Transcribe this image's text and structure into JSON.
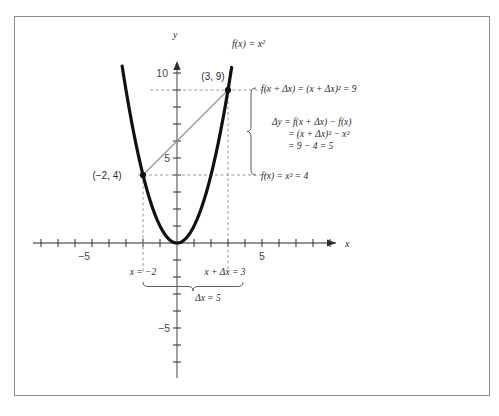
{
  "figure": {
    "watermark": "",
    "border_color": "#8a8a92",
    "background": "#ffffff"
  },
  "axes": {
    "x_axis_label": "x",
    "y_axis_label": "y",
    "x_tick_labels": [
      {
        "value": -5,
        "text": "−5"
      },
      {
        "value": 5,
        "text": "5"
      }
    ],
    "y_tick_labels": [
      {
        "value": 10,
        "text": "10"
      },
      {
        "value": 5,
        "text": "5"
      },
      {
        "value": -5,
        "text": "−5"
      }
    ],
    "x_min": -9,
    "x_max": 9,
    "y_min": -8,
    "y_max": 11,
    "tick_step": 1,
    "origin_px": {
      "x": 177,
      "y": 243
    },
    "unit_px": 17,
    "axis_color": "#6f6f74"
  },
  "curve": {
    "label": "f(x) = x²",
    "label_px": {
      "x": 232,
      "y": 47
    },
    "color": "#111111",
    "stroke_width": 3.2
  },
  "points": [
    {
      "name": "point-a",
      "label": "(−2, 4)",
      "x": -2,
      "y": 4,
      "label_px": {
        "x": 107,
        "y": 179
      }
    },
    {
      "name": "point-b",
      "label": "(3, 9)",
      "x": 3,
      "y": 9,
      "label_px": {
        "x": 200,
        "y": 80
      }
    }
  ],
  "secant": {
    "from": {
      "x": -2,
      "y": 4
    },
    "to": {
      "x": 3,
      "y": 9
    },
    "color": "#8d8d92"
  },
  "guides": {
    "color": "#9a9aa0",
    "dash": "3,2.5"
  },
  "annotations": {
    "top_right": "f(x + Δx) = (x + Δx)² = 9",
    "bottom_right": "f(x) = x² = 4",
    "delta_y_lines": [
      "Δy = f(x + Δx) − f(x)",
      "= (x + Δx)² − x²",
      "= 9 − 4 = 5"
    ],
    "x_left_label": "x = −2",
    "x_right_label": "x + Δx = 3",
    "delta_x_label": "Δx = 5"
  }
}
